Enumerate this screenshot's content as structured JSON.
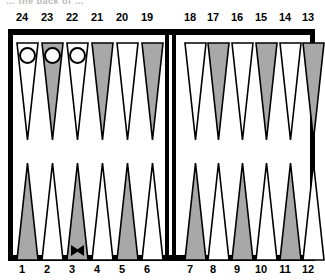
{
  "caption": "… the back of …",
  "colors": {
    "frame": "#000000",
    "point_light": "#ffffff",
    "point_dark": "#a8a8a8",
    "point_outline": "#000000",
    "checker_fill": "#ffffff",
    "checker_outline": "#000000",
    "label": "#000000",
    "background": "#ffffff"
  },
  "board": {
    "type": "backgammon-board",
    "top_labels": [
      "24",
      "23",
      "22",
      "21",
      "20",
      "19",
      "18",
      "17",
      "16",
      "15",
      "14",
      "13"
    ],
    "bottom_labels": [
      "1",
      "2",
      "3",
      "4",
      "5",
      "6",
      "7",
      "8",
      "9",
      "10",
      "11",
      "12"
    ],
    "top_points": [
      {
        "label": "24",
        "shade": "light"
      },
      {
        "label": "23",
        "shade": "dark"
      },
      {
        "label": "22",
        "shade": "light"
      },
      {
        "label": "21",
        "shade": "dark"
      },
      {
        "label": "20",
        "shade": "light"
      },
      {
        "label": "19",
        "shade": "dark"
      },
      {
        "label": "18",
        "shade": "light"
      },
      {
        "label": "17",
        "shade": "dark"
      },
      {
        "label": "16",
        "shade": "light"
      },
      {
        "label": "15",
        "shade": "dark"
      },
      {
        "label": "14",
        "shade": "light"
      },
      {
        "label": "13",
        "shade": "dark"
      }
    ],
    "bottom_points": [
      {
        "label": "1",
        "shade": "dark"
      },
      {
        "label": "2",
        "shade": "light"
      },
      {
        "label": "3",
        "shade": "dark"
      },
      {
        "label": "4",
        "shade": "light"
      },
      {
        "label": "5",
        "shade": "dark"
      },
      {
        "label": "6",
        "shade": "light"
      },
      {
        "label": "7",
        "shade": "dark"
      },
      {
        "label": "8",
        "shade": "light"
      },
      {
        "label": "9",
        "shade": "dark"
      },
      {
        "label": "10",
        "shade": "light"
      },
      {
        "label": "11",
        "shade": "dark"
      },
      {
        "label": "12",
        "shade": "light"
      }
    ],
    "checkers": [
      {
        "point": "24",
        "color": "white",
        "symbol": "open-circle"
      },
      {
        "point": "23",
        "color": "white",
        "symbol": "open-circle"
      },
      {
        "point": "22",
        "color": "white",
        "symbol": "open-circle"
      }
    ],
    "markers": [
      {
        "point": "3",
        "symbol": "x-mark"
      }
    ]
  }
}
